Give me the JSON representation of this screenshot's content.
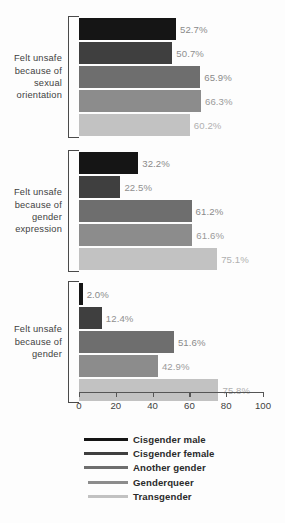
{
  "chart_data": {
    "type": "bar",
    "orientation": "horizontal",
    "title": "",
    "xlabel": "",
    "ylabel": "",
    "xlim": [
      0,
      100
    ],
    "xticks": [
      0,
      20,
      40,
      60,
      80,
      100
    ],
    "grid": false,
    "legend_position": "bottom",
    "categories": [
      "Felt unsafe because of sexual orientation",
      "Felt unsafe because of gender expression",
      "Felt unsafe because of gender"
    ],
    "category_lines": [
      [
        "Felt unsafe",
        "because of",
        "sexual",
        "orientation"
      ],
      [
        "Felt unsafe",
        "because of",
        "gender",
        "expression"
      ],
      [
        "Felt unsafe",
        "because of",
        "gender"
      ]
    ],
    "series": [
      {
        "name": "Cisgender male",
        "color": "#151515",
        "label_color": "#8a8a8a",
        "values": [
          52.7,
          32.2,
          2.0
        ],
        "value_labels": [
          "52.7%",
          "32.2%",
          "2.0%"
        ]
      },
      {
        "name": "Cisgender female",
        "color": "#3f3f3f",
        "label_color": "#8f8f8f",
        "values": [
          50.7,
          22.5,
          12.4
        ],
        "value_labels": [
          "50.7%",
          "22.5%",
          "12.4%"
        ]
      },
      {
        "name": "Another gender",
        "color": "#6e6e6e",
        "label_color": "#8b8b8b",
        "values": [
          65.9,
          61.2,
          51.6
        ],
        "value_labels": [
          "65.9%",
          "61.2%",
          "51.6%"
        ]
      },
      {
        "name": "Genderqueer",
        "color": "#8c8c8c",
        "label_color": "#9a9a9a",
        "values": [
          66.3,
          61.6,
          42.9
        ],
        "value_labels": [
          "66.3%",
          "61.6%",
          "42.9%"
        ]
      },
      {
        "name": "Transgender",
        "color": "#c2c2c2",
        "label_color": "#b0b0b0",
        "values": [
          60.2,
          75.1,
          75.8
        ],
        "value_labels": [
          "60.2%",
          "75.1%",
          "75.8%"
        ]
      }
    ]
  },
  "axis": {
    "tick_labels": [
      "0",
      "20",
      "40",
      "60",
      "80",
      "100"
    ]
  },
  "legend": {
    "items": [
      {
        "label": "Cisgender male",
        "color": "#151515",
        "swatch_width": 44
      },
      {
        "label": "Cisgender female",
        "color": "#3f3f3f",
        "swatch_width": 44
      },
      {
        "label": "Another gender",
        "color": "#6e6e6e",
        "swatch_width": 44
      },
      {
        "label": "Genderqueer",
        "color": "#8c8c8c",
        "swatch_width": 40
      },
      {
        "label": "Transgender",
        "color": "#c2c2c2",
        "swatch_width": 40
      }
    ]
  }
}
